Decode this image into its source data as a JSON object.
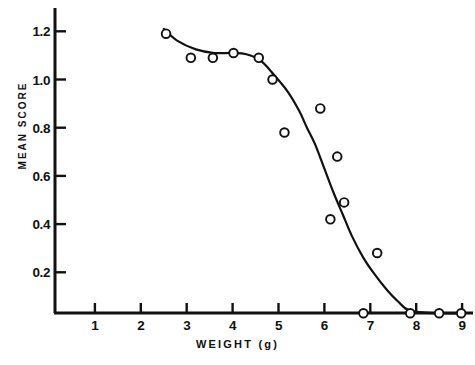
{
  "chart_data": {
    "type": "scatter",
    "title": "",
    "xlabel": "WEIGHT (g)",
    "ylabel": "MEAN SCORE",
    "xlim": [
      0,
      9.3
    ],
    "ylim": [
      0,
      1.3
    ],
    "xticks": [
      1,
      2,
      3,
      4,
      5,
      6,
      7,
      8,
      9
    ],
    "xtick_labels": [
      "1",
      "2",
      "3",
      "4",
      "5",
      "6",
      "7",
      "8",
      "9"
    ],
    "yticks": [
      0.2,
      0.4,
      0.6,
      0.8,
      1.0,
      1.2
    ],
    "ytick_labels": [
      "0.2",
      "0.4",
      "0.6",
      "0.8",
      "1.0",
      "1.2"
    ],
    "grid": false,
    "legend": false,
    "marker": "open-circle",
    "marker_color": "#111111",
    "line_color": "#111111",
    "series": [
      {
        "name": "observed",
        "type": "scatter",
        "points": [
          {
            "x": 2.55,
            "y": 1.19
          },
          {
            "x": 3.09,
            "y": 1.09
          },
          {
            "x": 3.57,
            "y": 1.09
          },
          {
            "x": 4.02,
            "y": 1.11
          },
          {
            "x": 4.57,
            "y": 1.09
          },
          {
            "x": 4.87,
            "y": 1.0
          },
          {
            "x": 5.13,
            "y": 0.78
          },
          {
            "x": 5.91,
            "y": 0.88
          },
          {
            "x": 6.28,
            "y": 0.68
          },
          {
            "x": 6.43,
            "y": 0.49
          },
          {
            "x": 6.13,
            "y": 0.42
          },
          {
            "x": 6.85,
            "y": 0.03
          },
          {
            "x": 7.15,
            "y": 0.28
          },
          {
            "x": 7.87,
            "y": 0.03
          },
          {
            "x": 8.5,
            "y": 0.03
          },
          {
            "x": 8.98,
            "y": 0.03
          }
        ]
      },
      {
        "name": "fitted-curve",
        "type": "line",
        "points": [
          {
            "x": 2.5,
            "y": 1.21
          },
          {
            "x": 2.8,
            "y": 1.16
          },
          {
            "x": 3.2,
            "y": 1.125
          },
          {
            "x": 3.6,
            "y": 1.11
          },
          {
            "x": 4.0,
            "y": 1.11
          },
          {
            "x": 4.3,
            "y": 1.105
          },
          {
            "x": 4.6,
            "y": 1.08
          },
          {
            "x": 4.9,
            "y": 1.02
          },
          {
            "x": 5.2,
            "y": 0.95
          },
          {
            "x": 5.45,
            "y": 0.87
          },
          {
            "x": 5.62,
            "y": 0.8
          },
          {
            "x": 5.8,
            "y": 0.73
          },
          {
            "x": 6.0,
            "y": 0.63
          },
          {
            "x": 6.2,
            "y": 0.53
          },
          {
            "x": 6.4,
            "y": 0.44
          },
          {
            "x": 6.6,
            "y": 0.35
          },
          {
            "x": 6.85,
            "y": 0.26
          },
          {
            "x": 7.1,
            "y": 0.19
          },
          {
            "x": 7.35,
            "y": 0.13
          },
          {
            "x": 7.6,
            "y": 0.08
          },
          {
            "x": 7.87,
            "y": 0.04
          },
          {
            "x": 8.5,
            "y": 0.03
          },
          {
            "x": 9.05,
            "y": 0.03
          }
        ]
      }
    ]
  }
}
